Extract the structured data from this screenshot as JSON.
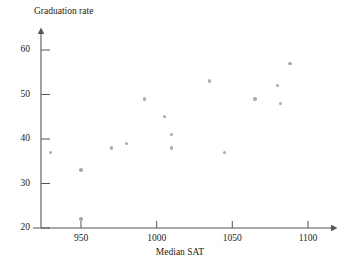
{
  "chart_data": {
    "type": "scatter",
    "title": "",
    "xlabel": "Median SAT",
    "ylabel": "Graduation rate",
    "xlim": [
      918,
      1118
    ],
    "ylim": [
      20,
      62
    ],
    "xticks": [
      950,
      1000,
      1050,
      1100
    ],
    "yticks": [
      20,
      30,
      40,
      50,
      60
    ],
    "grid": false,
    "legend": null,
    "marker_color": "#ababab",
    "axis_color": "#555555",
    "points": [
      {
        "x": 930,
        "y": 37
      },
      {
        "x": 950,
        "y": 33
      },
      {
        "x": 950,
        "y": 22
      },
      {
        "x": 970,
        "y": 38
      },
      {
        "x": 980,
        "y": 39
      },
      {
        "x": 992,
        "y": 49
      },
      {
        "x": 1005,
        "y": 45
      },
      {
        "x": 1010,
        "y": 41
      },
      {
        "x": 1010,
        "y": 38
      },
      {
        "x": 1035,
        "y": 53
      },
      {
        "x": 1045,
        "y": 37
      },
      {
        "x": 1065,
        "y": 49
      },
      {
        "x": 1080,
        "y": 52
      },
      {
        "x": 1082,
        "y": 48
      },
      {
        "x": 1088,
        "y": 57
      }
    ]
  },
  "axes": {
    "y_title": "Graduation rate",
    "x_title": "Median SAT",
    "y_tick_labels": [
      "20",
      "30",
      "40",
      "50",
      "60"
    ],
    "x_tick_labels": [
      "950",
      "1000",
      "1050",
      "1100"
    ]
  }
}
